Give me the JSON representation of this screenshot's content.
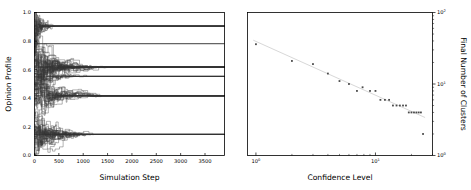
{
  "figure": {
    "width": 471,
    "height": 190,
    "background": "#ffffff",
    "ink_color": "#000000",
    "trajectory_color": "#3a3a3a",
    "fit_line_color": "#d8d8d8",
    "marker_color": "#4a4a4a"
  },
  "chart_data": [
    {
      "type": "line",
      "panel": "left",
      "title": "",
      "xlabel": "Simulation Step",
      "ylabel": "Opinion Profile",
      "xlim": [
        0,
        3900
      ],
      "ylim": [
        0.0,
        1.0
      ],
      "xscale": "linear",
      "yscale": "linear",
      "grid": false,
      "legend": "none",
      "xticks": [
        0,
        500,
        1000,
        1500,
        2000,
        2500,
        3000,
        3500
      ],
      "xticklabels": [
        "0",
        "500",
        "1000",
        "1500",
        "2000",
        "2500",
        "3000",
        "3500"
      ],
      "yticks": [
        0.0,
        0.2,
        0.4,
        0.6,
        0.8,
        1.0
      ],
      "yticklabels": [
        "0.0",
        "0.2",
        "0.4",
        "0.6",
        "0.8",
        "1.0"
      ],
      "description": "Bounded-confidence opinion dynamics: many agent opinion trajectories starting spread over [0,1] merge over simulation steps into a small number of horizontal consensus clusters.",
      "n_agents": 120,
      "final_clusters": [
        {
          "opinion": 0.905,
          "converged_step": 330,
          "members": 14
        },
        {
          "opinion": 0.782,
          "converged_step": 60,
          "members": 2
        },
        {
          "opinion": 0.618,
          "converged_step": 1180,
          "members": 38
        },
        {
          "opinion": 0.553,
          "converged_step": 900,
          "members": 10
        },
        {
          "opinion": 0.418,
          "converged_step": 1060,
          "members": 26
        },
        {
          "opinion": 0.147,
          "converged_step": 1010,
          "members": 30
        }
      ],
      "initial_opinion_range": [
        0.01,
        1.0
      ],
      "converged_lines_y": [
        0.905,
        0.782,
        0.618,
        0.553,
        0.418,
        0.147
      ]
    },
    {
      "type": "scatter",
      "panel": "right",
      "title": "",
      "xlabel": "Confidence Level",
      "ylabel": "Final Number of Clusters",
      "xscale": "log",
      "yscale": "log",
      "xlim": [
        0.85,
        30
      ],
      "ylim": [
        1,
        100
      ],
      "grid": false,
      "legend": "none",
      "yaxis_position": "right",
      "xticks": [
        1,
        10
      ],
      "xticklabels": [
        "10^0",
        "10^1"
      ],
      "yticks": [
        1,
        10,
        100
      ],
      "yticklabels": [
        "10^0",
        "10^1",
        "10^2"
      ],
      "description": "Final number of opinion clusters decreases as a power law with increasing confidence level; a pale grey power-law fit line is overlaid on the scatter of measured points.",
      "x": [
        1.0,
        2.0,
        3.0,
        4.0,
        5.0,
        6.0,
        7.0,
        7.8,
        9.0,
        10.0,
        11.0,
        12.0,
        13.0,
        14.0,
        15.0,
        16.0,
        17.0,
        18.0,
        19.0,
        20.0,
        21.0,
        22.0,
        23.0,
        24.0,
        25.0
      ],
      "y": [
        36,
        21,
        19,
        14,
        11,
        10,
        8,
        9,
        8,
        8,
        6,
        6,
        6,
        5,
        5,
        5,
        5,
        5,
        4,
        4,
        4,
        4,
        4,
        4,
        2
      ],
      "fit": {
        "form": "power-law",
        "x_start": 0.95,
        "y_start": 41,
        "x_end": 26,
        "y_end": 3.4
      }
    }
  ],
  "left_panel": {
    "xlabel": "Simulation Step",
    "ylabel": "Opinion Profile",
    "xticklabels": [
      "0",
      "500",
      "1000",
      "1500",
      "2000",
      "2500",
      "3000",
      "3500"
    ],
    "yticklabels": [
      "0.0",
      "0.2",
      "0.4",
      "0.6",
      "0.8",
      "1.0"
    ]
  },
  "right_panel": {
    "xlabel": "Confidence Level",
    "ylabel": "Final Number of Clusters",
    "xticklabels": [
      {
        "mantissa": "10",
        "exponent": "0"
      },
      {
        "mantissa": "10",
        "exponent": "1"
      }
    ],
    "yticklabels": [
      {
        "mantissa": "10",
        "exponent": "0"
      },
      {
        "mantissa": "10",
        "exponent": "1"
      },
      {
        "mantissa": "10",
        "exponent": "2"
      }
    ]
  }
}
